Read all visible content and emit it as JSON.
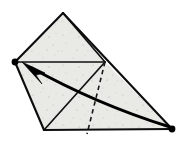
{
  "figure": {
    "canvas": {
      "width": 189,
      "height": 141
    },
    "colors": {
      "paper_fill": "#e9e9e6",
      "paper_speckle": "#b9b9b4",
      "ink": "#0d0d0d",
      "background": "#ffffff"
    }
  },
  "shape": {
    "name": "folded-paper-outline",
    "outline_points": "63,13 105,62 172,129 44,130 15,62",
    "vertices": [
      {
        "name": "apex",
        "x": 63,
        "y": 13,
        "marked": false
      },
      {
        "name": "left-corner",
        "x": 15,
        "y": 62,
        "marked": true
      },
      {
        "name": "mid-right",
        "x": 105,
        "y": 62,
        "marked": false
      },
      {
        "name": "right-corner",
        "x": 172,
        "y": 129,
        "marked": true
      },
      {
        "name": "bottom-left-corner",
        "x": 44,
        "y": 130,
        "marked": false
      }
    ]
  },
  "lines": {
    "edges": [
      {
        "name": "edge-apex-to-left-corner",
        "kind": "solid",
        "path": "M 63 13 L 15 62"
      },
      {
        "name": "edge-left-corner-to-bottom-left",
        "kind": "solid",
        "path": "M 15 62 L 44 130"
      },
      {
        "name": "edge-bottom",
        "kind": "solid",
        "path": "M 44 130 L 172 129"
      },
      {
        "name": "edge-apex-to-right-corner",
        "kind": "solid",
        "path": "M 63 13 L 172 129"
      }
    ],
    "creases_solid": [
      {
        "name": "crease-horizontal",
        "path": "M 15 62 L 105 62"
      },
      {
        "name": "crease-mid-to-bottom-left",
        "path": "M 105 62 L 44 130"
      },
      {
        "name": "crease-apex-to-mid",
        "path": "M 63 13 L 105 62"
      }
    ],
    "creases_dashed": [
      {
        "name": "crease-dashed-hidden-fold",
        "path": "M 105 62 L 87 134"
      }
    ]
  },
  "arrow": {
    "name": "fold-direction-arrow",
    "from_vertex": "right-corner",
    "to_vertex": "left-corner",
    "curve_path": "M 170 127 Q 96 104 30 67",
    "head_points": "22,62 45,73 36,75 42,84",
    "meaning": "fold right corner over to left corner"
  },
  "dots": [
    {
      "name": "vertex-dot-left",
      "x": 15,
      "y": 62,
      "r": 3.4
    },
    {
      "name": "vertex-dot-right",
      "x": 172,
      "y": 129,
      "r": 3.4
    }
  ],
  "labels": {
    "none_present": ""
  }
}
